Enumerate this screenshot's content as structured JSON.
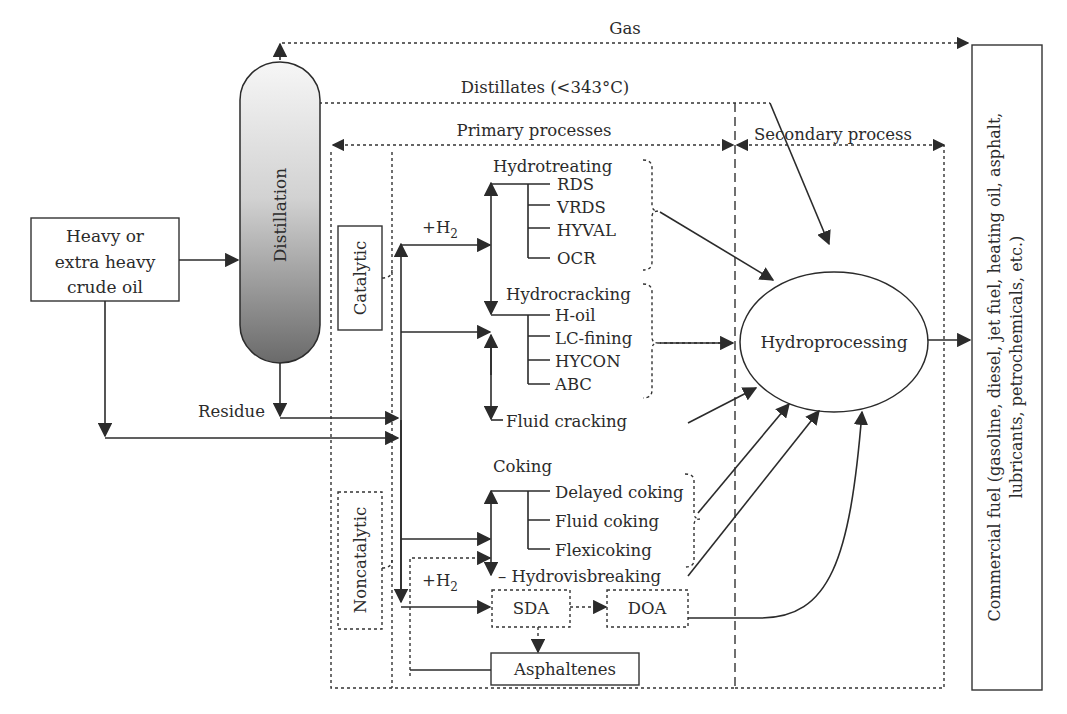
{
  "diagram": {
    "type": "process-flow",
    "colors": {
      "stroke": "#2b2b2b",
      "text": "#2b2b2b",
      "column_gradient_top": "#f4f4f4",
      "column_gradient_bottom": "#6e6e6e"
    }
  },
  "nodes": {
    "feed": {
      "line1": "Heavy or",
      "line2": "extra heavy",
      "line3": "crude oil"
    },
    "distillation": "Distillation",
    "hydroprocessing": "Hydroprocessing",
    "commercial": {
      "line1": "Commercial fuel (gasoline, diesel, jet fuel, heating oil, asphalt,",
      "line2": "lubricants, petrochemicals, etc.)"
    },
    "catalytic": "Catalytic",
    "noncatalytic": "Noncatalytic",
    "sda": "SDA",
    "doa": "DOA",
    "asphaltenes": "Asphaltenes"
  },
  "flows": {
    "gas": "Gas",
    "distillates": "Distillates (<343°C)",
    "residue": "Residue",
    "h2_top": {
      "base": "+H",
      "sub": "2"
    },
    "h2_bottom": {
      "base": "+H",
      "sub": "2"
    }
  },
  "regions": {
    "primary": "Primary processes",
    "secondary": "Secondary process"
  },
  "processes": {
    "hydrotreating": {
      "title": "Hydrotreating",
      "items": [
        "RDS",
        "VRDS",
        "HYVAL",
        "OCR"
      ]
    },
    "hydrocracking": {
      "title": "Hydrocracking",
      "items": [
        "H-oil",
        "LC-fining",
        "HYCON",
        "ABC"
      ]
    },
    "fluid_cracking": "Fluid cracking",
    "coking": {
      "title": "Coking",
      "items": [
        "Delayed coking",
        "Fluid coking",
        "Flexicoking"
      ]
    },
    "hydrovisbreaking": "– Hydrovisbreaking"
  }
}
